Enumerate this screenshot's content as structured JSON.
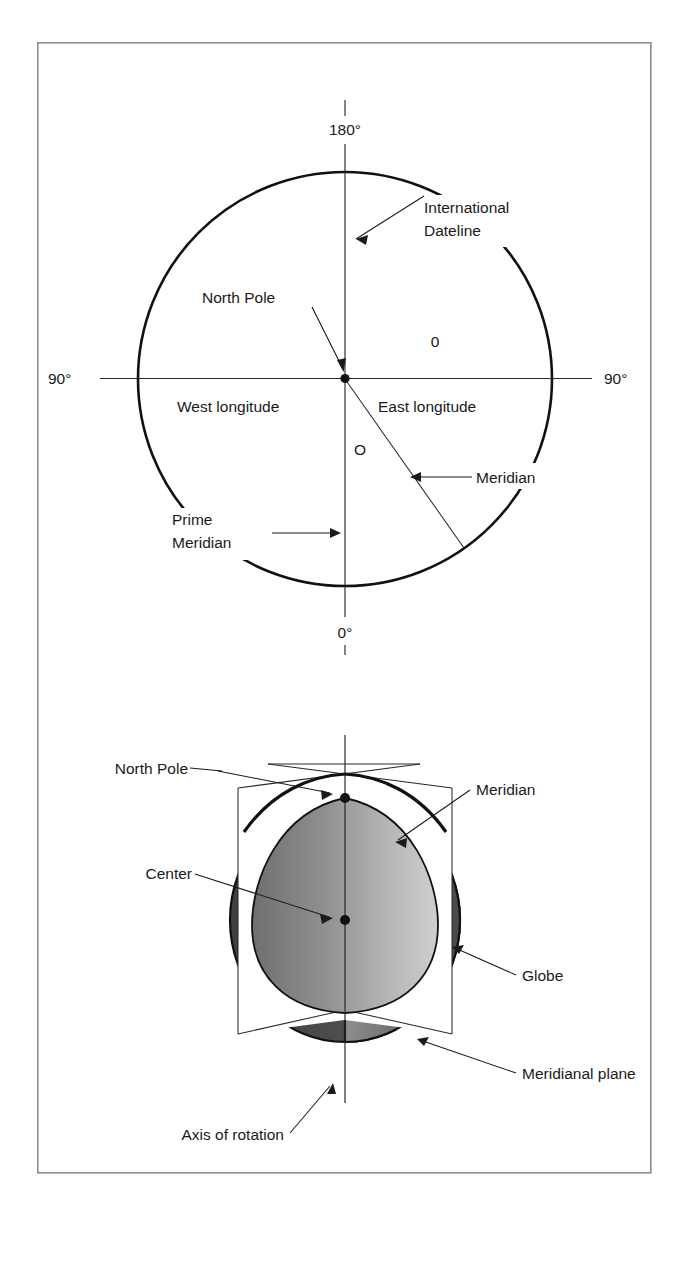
{
  "figure": {
    "title_hidden": "",
    "frame": {
      "x": 37,
      "y": 42,
      "width": 614,
      "height": 1131,
      "border_color": "#8d8d8d"
    }
  },
  "top_diagram": {
    "name": "longitude-reference-circle",
    "description": "Polar view of Earth showing meridians, prime meridian and international dateline",
    "circle": {
      "center_x": 345,
      "center_y": 379,
      "radius": 207
    },
    "axis_labels": {
      "top": "180°",
      "bottom": "0°",
      "left": "90°",
      "right": "90°"
    },
    "labels": [
      {
        "id": "international-dateline",
        "text_lines": [
          "International",
          "Dateline"
        ]
      },
      {
        "id": "north-pole",
        "text_lines": [
          "North Pole"
        ]
      },
      {
        "id": "west-longitude",
        "text_lines": [
          "West longitude"
        ]
      },
      {
        "id": "east-longitude",
        "text_lines": [
          "East longitude"
        ]
      },
      {
        "id": "prime-meridian",
        "text_lines": [
          "Prime",
          "Meridian"
        ]
      },
      {
        "id": "meridian",
        "text_lines": [
          "Meridian"
        ]
      },
      {
        "id": "angle-zero",
        "text_lines": [
          "0"
        ]
      },
      {
        "id": "origin-o",
        "text_lines": [
          "O"
        ]
      }
    ]
  },
  "bottom_diagram": {
    "name": "globe-meridional-plane",
    "description": "Three dimensional globe cut by a meridianal plane through the axis of rotation",
    "colors": {
      "globe_dark": "#4a4a4a",
      "meridian_light": "#9a9a9a",
      "plane_white": "#ffffff",
      "outline": "#111111"
    },
    "labels": [
      {
        "id": "north-pole",
        "text_lines": [
          "North Pole"
        ]
      },
      {
        "id": "meridian",
        "text_lines": [
          "Meridian"
        ]
      },
      {
        "id": "center",
        "text_lines": [
          "Center"
        ]
      },
      {
        "id": "globe",
        "text_lines": [
          "Globe"
        ]
      },
      {
        "id": "meridianal-plane",
        "text_lines": [
          "Meridianal plane"
        ]
      },
      {
        "id": "axis-of-rotation",
        "text_lines": [
          "Axis of rotation"
        ]
      }
    ]
  }
}
